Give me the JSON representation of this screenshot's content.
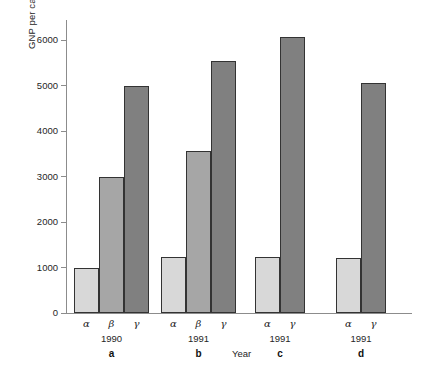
{
  "chart_data": {
    "type": "bar",
    "title": "",
    "xlabel": "Year",
    "ylabel": "GNP per capita (U.S. dollars)",
    "ylim": [
      0,
      6500
    ],
    "yticks": [
      0,
      1000,
      2000,
      3000,
      4000,
      5000,
      6000
    ],
    "ytick_labels": [
      "0",
      "1000",
      "2000",
      "3000",
      "4000",
      "5000",
      "6000"
    ],
    "grid": false,
    "legend": "none",
    "categories": [
      "α",
      "β",
      "γ"
    ],
    "panels": [
      {
        "panel_label": "a",
        "year": "1990",
        "bars": [
          {
            "category": "α",
            "value": 1000,
            "color": "#d8d8d8"
          },
          {
            "category": "β",
            "value": 2980,
            "color": "#a6a6a6"
          },
          {
            "category": "γ",
            "value": 4980,
            "color": "#808080"
          }
        ]
      },
      {
        "panel_label": "b",
        "year": "1991",
        "bars": [
          {
            "category": "α",
            "value": 1230,
            "color": "#d8d8d8"
          },
          {
            "category": "β",
            "value": 3550,
            "color": "#a6a6a6"
          },
          {
            "category": "γ",
            "value": 5540,
            "color": "#808080"
          }
        ]
      },
      {
        "panel_label": "c",
        "year": "1991",
        "bars": [
          {
            "category": "α",
            "value": 1220,
            "color": "#d8d8d8"
          },
          {
            "category": "γ",
            "value": 6070,
            "color": "#808080"
          }
        ]
      },
      {
        "panel_label": "d",
        "year": "1991",
        "bars": [
          {
            "category": "α",
            "value": 1200,
            "color": "#d8d8d8"
          },
          {
            "category": "γ",
            "value": 5060,
            "color": "#808080"
          }
        ]
      }
    ]
  },
  "axis": {
    "y_title": "GNP per capita (U.S. dollars)",
    "x_title": "Year"
  },
  "colors": {
    "bar_light": "#d8d8d8",
    "bar_medium": "#a6a6a6",
    "bar_dark": "#808080",
    "bar_edge": "#333333",
    "axis": "#8c8c8c",
    "text": "#262626",
    "background": "#ffffff"
  }
}
